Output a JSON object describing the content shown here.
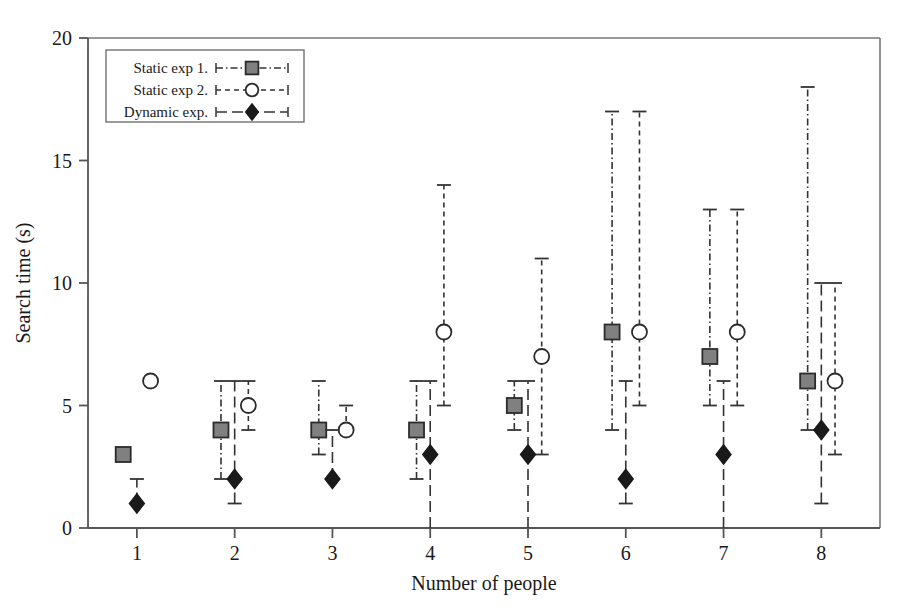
{
  "chart_data": {
    "type": "scatter",
    "title": "",
    "xlabel": "Number of people",
    "ylabel": "Search time (s)",
    "xlim": [
      0.5,
      8.6
    ],
    "ylim": [
      0,
      20
    ],
    "xticks": [
      1,
      2,
      3,
      4,
      5,
      6,
      7,
      8
    ],
    "xtick_labels": [
      "1",
      "2",
      "3",
      "4",
      "5",
      "6",
      "7",
      "8"
    ],
    "yticks": [
      0,
      5,
      10,
      15,
      20
    ],
    "ytick_labels": [
      "0",
      "5",
      "10",
      "15",
      "20"
    ],
    "grid": false,
    "legend_position": "top-left",
    "categories": [
      1,
      2,
      3,
      4,
      5,
      6,
      7,
      8
    ],
    "series": [
      {
        "name": "Static exp 1.",
        "marker": "square",
        "marker_fill": "#808080",
        "marker_edge": "#2b2b2b",
        "line_style": "dash-dot",
        "x_offset": -0.14,
        "values": [
          3,
          4,
          4,
          4,
          5,
          8,
          7,
          6
        ],
        "err_low": [
          3,
          2,
          3,
          2,
          4,
          4,
          5,
          4
        ],
        "err_high": [
          3,
          6,
          6,
          6,
          6,
          17,
          13,
          18
        ]
      },
      {
        "name": "Static exp 2.",
        "marker": "circle",
        "marker_fill": "#ffffff",
        "marker_edge": "#2b2b2b",
        "line_style": "dashed",
        "x_offset": 0.14,
        "values": [
          6,
          5,
          4,
          8,
          7,
          8,
          8,
          6
        ],
        "err_low": [
          6,
          4,
          4,
          5,
          3,
          5,
          5,
          3
        ],
        "err_high": [
          6,
          6,
          5,
          14,
          11,
          17,
          13,
          10
        ]
      },
      {
        "name": "Dynamic exp.",
        "marker": "diamond",
        "marker_fill": "#1a1a1a",
        "marker_edge": "#1a1a1a",
        "line_style": "long-dash",
        "x_offset": 0.0,
        "values": [
          1,
          2,
          2,
          3,
          3,
          2,
          3,
          4
        ],
        "err_low": [
          1,
          1,
          2,
          0,
          0,
          1,
          0,
          1
        ],
        "err_high": [
          2,
          6,
          4,
          6,
          6,
          6,
          6,
          10
        ]
      }
    ]
  },
  "legend": {
    "entries": [
      {
        "label": "Static exp 1."
      },
      {
        "label": "Static exp 2."
      },
      {
        "label": "Dynamic exp."
      }
    ]
  },
  "colors": {
    "axis": "#555555",
    "frame": "#777777",
    "text": "#1a1a1a",
    "square_fill": "#808080",
    "circle_fill": "#ffffff",
    "diamond_fill": "#1a1a1a",
    "background": "#ffffff"
  }
}
